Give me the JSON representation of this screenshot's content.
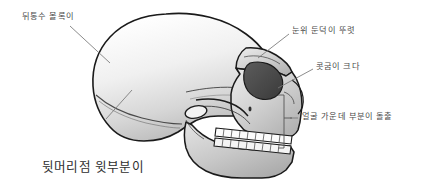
{
  "figure": {
    "background_color": "#ffffff",
    "outline_color": "#1a1a1a",
    "bone_light_color": "#fdfdfd",
    "bone_mid_color": "#d9d9d9",
    "bone_shadow_color": "#b0b0b0",
    "eye_socket_color": "#4a4a4a",
    "leader_line_color": "#777777",
    "bracket_color": "#555555"
  },
  "labels": {
    "occiput_bulge": "뒤통수 볼록이",
    "brow_ridge": "눈위 둔덕이 뚜렷",
    "nasal_large": "콧굼이 크다",
    "midface_projection": "얼굴 가운데 부분이 돌출",
    "parietal_flat_line1": "뒷머리점 윗부분이",
    "parietal_flat_line2": "오목함"
  }
}
